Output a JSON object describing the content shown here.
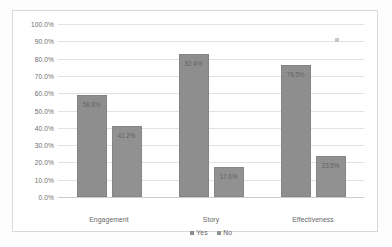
{
  "chart_data": {
    "type": "bar",
    "title": "",
    "subtitle": "",
    "xlabel": "",
    "ylabel": "",
    "categories": [
      "Engagement",
      "Story",
      "Effectiveness"
    ],
    "series": [
      {
        "name": "Yes",
        "values": [
          58.8,
          82.4,
          76.5
        ],
        "color": "#8e8e8e"
      },
      {
        "name": "No",
        "values": [
          41.2,
          17.6,
          23.5
        ],
        "color": "#919191"
      }
    ],
    "data_labels": [
      [
        "58.8%",
        "82.4%",
        "76.5%"
      ],
      [
        "41.2%",
        "17.6%",
        "23.5%"
      ]
    ],
    "ylim": [
      0,
      100
    ],
    "ytick_labels": [
      "100.0%",
      "90.0%",
      "80.0%",
      "70.0%",
      "60.0%",
      "50.0%",
      "40.0%",
      "30.0%",
      "20.0%",
      "10.0%",
      "0.0%"
    ],
    "ytick_values": [
      100,
      90,
      80,
      70,
      60,
      50,
      40,
      30,
      20,
      10,
      0
    ],
    "grid": true,
    "legend_position": "bottom",
    "value_suffix": "%"
  },
  "legend": {
    "items": [
      {
        "label": "Yes"
      },
      {
        "label": "No"
      }
    ]
  }
}
